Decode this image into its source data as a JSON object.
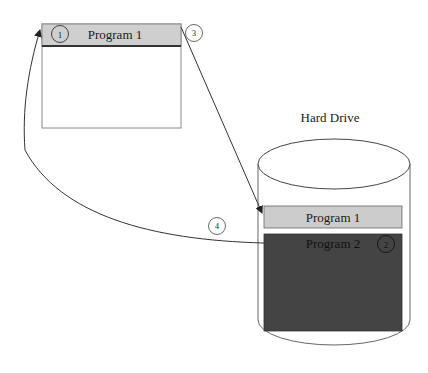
{
  "window": {
    "title": "Program 1",
    "step_badge": "1",
    "title_bar_color": "#cfcfcf",
    "border_color": "#8a8a8a"
  },
  "hard_drive": {
    "label": "Hard Drive",
    "slots": [
      {
        "label": "Program 1",
        "fill": "#cccccc"
      },
      {
        "label": "Program 2",
        "fill": "#444444",
        "step_badge": "2"
      }
    ]
  },
  "arrows": [
    {
      "name": "save-arrow",
      "from": "window",
      "to": "hard-drive-program-1",
      "step_badge": "3"
    },
    {
      "name": "load-arrow",
      "from": "hard-drive-program-2",
      "to": "window",
      "step_badge": "4"
    }
  ]
}
